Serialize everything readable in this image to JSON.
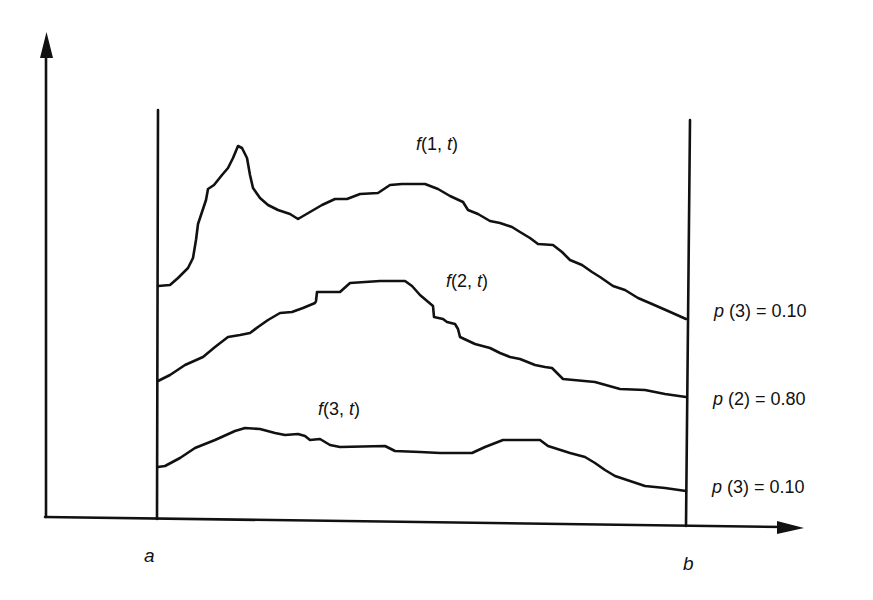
{
  "figure": {
    "type": "diagram",
    "axes": {
      "x_axis": {
        "has_arrow": true
      },
      "y_axis": {
        "has_arrow": true
      }
    },
    "bounds": {
      "left": {
        "label": "a"
      },
      "right": {
        "label": "b"
      }
    },
    "curves": [
      {
        "id": "curve-1",
        "label_func": "f",
        "label_index": "1",
        "label_var": "t",
        "label": "f(1, t)"
      },
      {
        "id": "curve-2",
        "label_func": "f",
        "label_index": "2",
        "label_var": "t",
        "label": "f(2, t)"
      },
      {
        "id": "curve-3",
        "label_func": "f",
        "label_index": "3",
        "label_var": "t",
        "label": "f(3, t)"
      }
    ],
    "probabilities": [
      {
        "func": "p",
        "index": "3",
        "value": "0.10",
        "label": "p (3) = 0.10"
      },
      {
        "func": "p",
        "index": "2",
        "value": "0.80",
        "label": "p (2) = 0.80"
      },
      {
        "func": "p",
        "index": "3",
        "value": "0.10",
        "label": "p (3) = 0.10"
      }
    ]
  }
}
